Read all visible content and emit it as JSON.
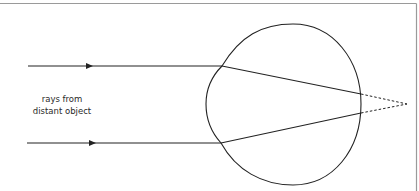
{
  "diagram": {
    "title": "",
    "label": {
      "line1": "rays from",
      "line2": "distant object"
    },
    "colors": {
      "stroke": "#222222",
      "frame": "#9a9a9a",
      "background": "#ffffff",
      "text": "#2a2a2a"
    },
    "elements": {
      "incoming_rays": [
        {
          "name": "upper-ray",
          "from": [
            28,
            66
          ],
          "to": [
            222,
            66
          ],
          "arrow_at": [
            92,
            66
          ]
        },
        {
          "name": "lower-ray",
          "from": [
            27,
            143
          ],
          "to": [
            221,
            143
          ],
          "arrow_at": [
            95,
            143
          ]
        }
      ],
      "refracted_rays": [
        {
          "name": "upper-refracted",
          "from": [
            222,
            66
          ],
          "to": [
            361,
            94
          ]
        },
        {
          "name": "lower-refracted",
          "from": [
            221,
            143
          ],
          "to": [
            361,
            113
          ]
        }
      ],
      "virtual_rays": [
        {
          "name": "upper-extension",
          "from": [
            361,
            94
          ],
          "to": [
            407,
            104
          ]
        },
        {
          "name": "lower-extension",
          "from": [
            361,
            113
          ],
          "to": [
            407,
            104
          ]
        }
      ],
      "focal_point": [
        407,
        104
      ],
      "eye": "eyeball outline with cornea bulge on left"
    }
  }
}
